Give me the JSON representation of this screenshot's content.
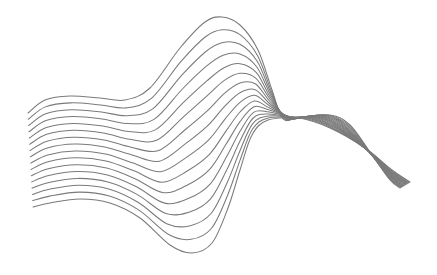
{
  "illustration": {
    "title": "Abstract wave line art",
    "background": "#ffffff",
    "stroke_color": "#7a7a7a",
    "stroke_width": 1.05,
    "line_count": 16,
    "top_curve": [
      [
        28,
        113
      ],
      [
        45,
        100
      ],
      [
        70,
        96
      ],
      [
        100,
        98
      ],
      [
        125,
        100
      ],
      [
        150,
        88
      ],
      [
        180,
        48
      ],
      [
        205,
        22
      ],
      [
        222,
        17
      ],
      [
        240,
        25
      ],
      [
        258,
        50
      ],
      [
        272,
        90
      ],
      [
        283,
        119
      ],
      [
        300,
        118
      ],
      [
        330,
        128
      ],
      [
        365,
        148
      ],
      [
        392,
        170
      ],
      [
        410,
        182
      ]
    ],
    "bottom_curve": [
      [
        33,
        207
      ],
      [
        50,
        203
      ],
      [
        80,
        199
      ],
      [
        110,
        203
      ],
      [
        140,
        218
      ],
      [
        170,
        245
      ],
      [
        192,
        253
      ],
      [
        212,
        243
      ],
      [
        228,
        208
      ],
      [
        240,
        170
      ],
      [
        252,
        135
      ],
      [
        268,
        120
      ],
      [
        300,
        117
      ],
      [
        330,
        115
      ],
      [
        350,
        125
      ],
      [
        372,
        155
      ],
      [
        390,
        180
      ],
      [
        400,
        188
      ]
    ]
  }
}
